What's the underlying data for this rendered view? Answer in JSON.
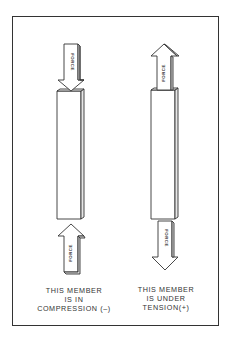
{
  "diagram": {
    "colors": {
      "line": "#333333",
      "background": "#ffffff"
    },
    "members": [
      {
        "id": "compression",
        "arrow_label_top": "FORCE",
        "arrow_label_bottom": "FORCE",
        "arrow_direction_top": "down",
        "arrow_direction_bottom": "up",
        "caption_lines": [
          "THIS MEMBER",
          "IS IN",
          "COMPRESSION (–)"
        ]
      },
      {
        "id": "tension",
        "arrow_label_top": "FORCE",
        "arrow_label_bottom": "FORCE",
        "arrow_direction_top": "up",
        "arrow_direction_bottom": "down",
        "caption_lines": [
          "THIS MEMBER",
          "IS UNDER",
          "TENSION(+)"
        ]
      }
    ]
  }
}
